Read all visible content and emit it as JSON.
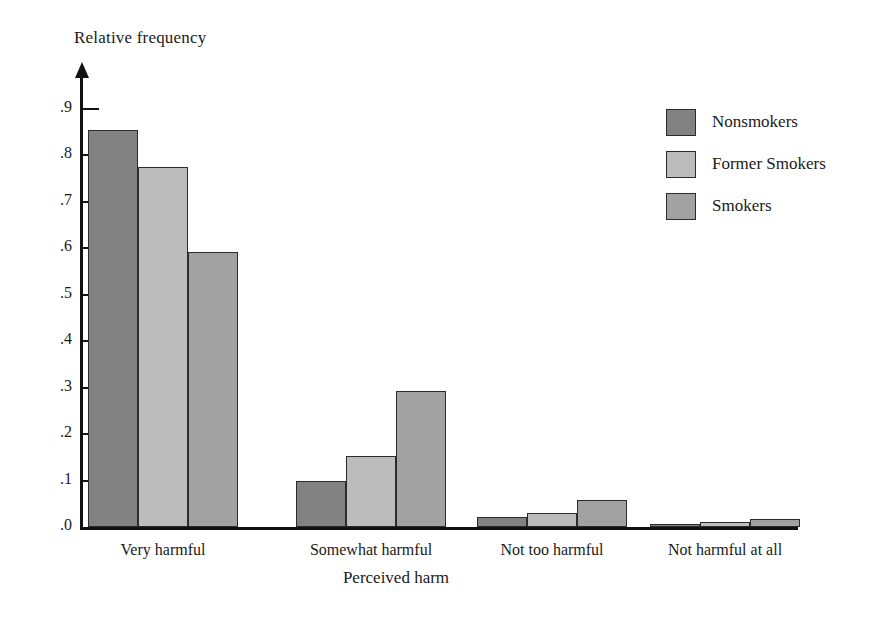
{
  "chart_data": {
    "type": "bar",
    "title": "",
    "xlabel": "Perceived harm",
    "ylabel": "Relative frequency",
    "categories": [
      "Very harmful",
      "Somewhat harmful",
      "Not too harmful",
      "Not harmful at all"
    ],
    "series": [
      {
        "name": "Nonsmokers",
        "color": "#828282",
        "values": [
          0.855,
          0.098,
          0.022,
          0.006
        ]
      },
      {
        "name": "Former Smokers",
        "color": "#bcbcbc",
        "values": [
          0.775,
          0.153,
          0.03,
          0.01
        ]
      },
      {
        "name": "Smokers",
        "color": "#a2a2a2",
        "values": [
          0.593,
          0.293,
          0.058,
          0.018
        ]
      }
    ],
    "ylim": [
      0.0,
      0.95
    ],
    "ytick_values": [
      0.0,
      0.1,
      0.2,
      0.3,
      0.4,
      0.5,
      0.6,
      0.7,
      0.8,
      0.9
    ],
    "ytick_labels": [
      ".0",
      ".1",
      ".2",
      ".3",
      ".4",
      ".5",
      ".6",
      ".7",
      ".8",
      ".9"
    ],
    "grid": false,
    "legend_position": "right-top",
    "legend": [
      "Nonsmokers",
      "Former Smokers",
      "Smokers"
    ]
  },
  "axes": {
    "y_title": "Relative frequency",
    "x_title": "Perceived harm"
  }
}
